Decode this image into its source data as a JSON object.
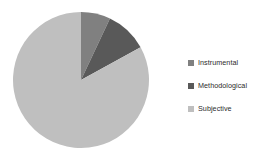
{
  "chart_data": {
    "type": "pie",
    "title": "",
    "subtitle": "",
    "xlabel": "",
    "ylabel": "",
    "grid": false,
    "legend_position": "right",
    "start_angle_deg": 0,
    "direction": "clockwise",
    "categories": [
      "Instrumental",
      "Methodological",
      "Subjective"
    ],
    "values": [
      7,
      10,
      83
    ],
    "units": "percent",
    "colors": [
      "#808080",
      "#595959",
      "#bfbfbf"
    ],
    "slices": [
      {
        "label": "Instrumental",
        "value": 7,
        "color": "#808080",
        "start_angle_deg": 0,
        "end_angle_deg": 25.2
      },
      {
        "label": "Methodological",
        "value": 10,
        "color": "#595959",
        "start_angle_deg": 25.2,
        "end_angle_deg": 61.2
      },
      {
        "label": "Subjective",
        "value": 83,
        "color": "#bfbfbf",
        "start_angle_deg": 61.2,
        "end_angle_deg": 360
      }
    ]
  },
  "legend": {
    "items": [
      {
        "label": "Instrumental",
        "swatch_color": "#808080",
        "swatch_icon": "square-marker-icon"
      },
      {
        "label": "Methodological",
        "swatch_color": "#595959",
        "swatch_icon": "square-marker-icon"
      },
      {
        "label": "Subjective",
        "swatch_color": "#bfbfbf",
        "swatch_icon": "square-marker-icon"
      }
    ]
  },
  "geometry": {
    "center_x": 81,
    "center_y": 80,
    "radius": 68
  }
}
